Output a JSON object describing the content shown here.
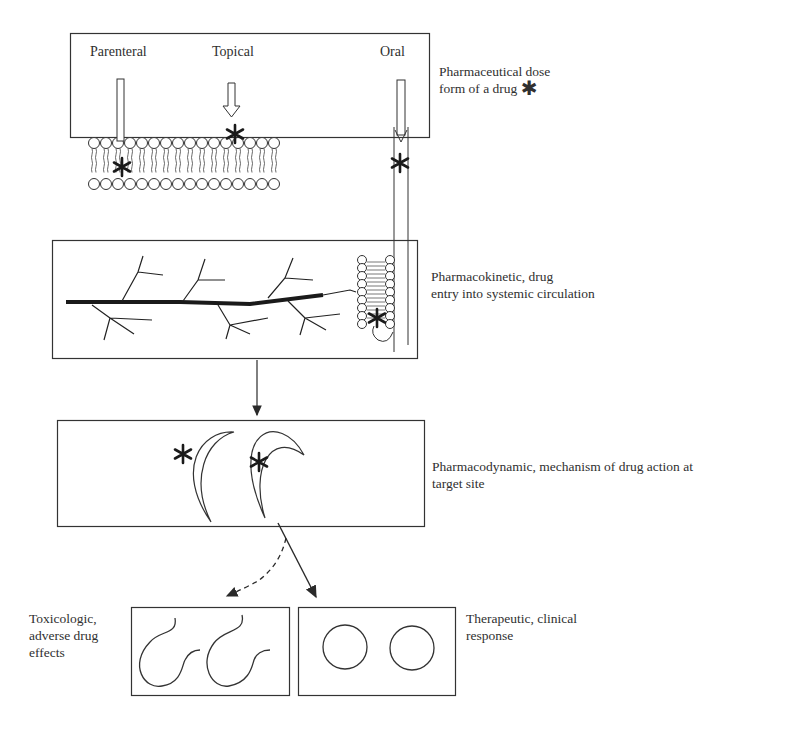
{
  "diagram": {
    "routes": [
      {
        "id": "parenteral",
        "label": "Parenteral"
      },
      {
        "id": "topical",
        "label": "Topical"
      },
      {
        "id": "oral",
        "label": "Oral"
      }
    ],
    "stages": [
      {
        "id": "pharmaceutical",
        "line1": "Pharmaceutical dose",
        "line2": "form of a drug",
        "symbol": "✱"
      },
      {
        "id": "pharmacokinetic",
        "line1": "Pharmacokinetic, drug",
        "line2": "entry into systemic circulation"
      },
      {
        "id": "pharmacodynamic",
        "line1": "Pharmacodynamic, mechanism of drug action at",
        "line2": "target site"
      }
    ],
    "outcomes": [
      {
        "id": "toxicologic",
        "line1": "Toxicologic,",
        "line2": "adverse drug",
        "line3": "effects",
        "arrow": "dashed"
      },
      {
        "id": "therapeutic",
        "line1": "Therapeutic, clinical",
        "line2": "response",
        "arrow": "solid"
      }
    ],
    "drug_symbol": "asterisk",
    "colors": {
      "stroke": "#2a2a2a",
      "background": "#ffffff",
      "vessel": "#1a1a1a"
    }
  }
}
